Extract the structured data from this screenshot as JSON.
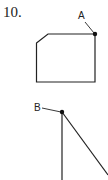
{
  "problem": {
    "number": "10."
  },
  "figures": [
    {
      "id": "figure-1",
      "shape": "pentagon-chamfered-rectangle",
      "point_label": "A",
      "point_location": "top-right corner"
    },
    {
      "id": "figure-2",
      "shape": "angle",
      "point_label": "B",
      "point_location": "vertex"
    }
  ],
  "colors": {
    "stroke": "#222222",
    "background": "#ffffff"
  }
}
